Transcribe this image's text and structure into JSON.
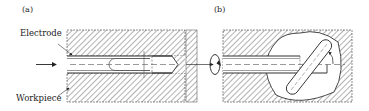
{
  "figure": {
    "panels": [
      {
        "id": "a",
        "label": "(a)"
      },
      {
        "id": "b",
        "label": "(b)"
      }
    ],
    "labels": {
      "electrode": "Electrode",
      "workpiece": "Workpiece"
    },
    "colors": {
      "line": "#333333",
      "hatch": "#555555",
      "background": "#ffffff"
    }
  }
}
